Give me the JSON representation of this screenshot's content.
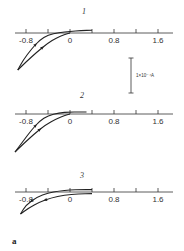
{
  "chart_data": {
    "type": "line",
    "title": "",
    "panel_label": "a",
    "xlabel": "",
    "ylabel": "",
    "x_ticks": [
      -0.8,
      -0.4,
      0,
      0.4,
      0.8,
      1.2,
      1.6
    ],
    "x_tick_labels": [
      "-0.8",
      "0",
      "0.8",
      "1.6"
    ],
    "x_tick_label_values": [
      -0.8,
      0,
      0.8,
      1.6
    ],
    "xlim": [
      -1.05,
      1.85
    ],
    "scale_bar": {
      "label": "1×10⁻⁴A",
      "value_A": 0.0001
    },
    "y_units_per_scale_bar": 1,
    "plots": [
      {
        "label": "1",
        "forward": {
          "x": [
            -0.95,
            -0.8,
            -0.6,
            -0.4,
            -0.25,
            -0.1,
            0.0
          ],
          "y": [
            -1.85,
            -1.45,
            -0.95,
            -0.5,
            -0.25,
            -0.08,
            0.0
          ]
        },
        "reverse": {
          "x": [
            0.4,
            0.2,
            0.0,
            -0.2,
            -0.4,
            -0.55,
            -0.7,
            -0.85,
            -0.95
          ],
          "y": [
            0.14,
            0.12,
            0.08,
            0.02,
            -0.1,
            -0.35,
            -0.8,
            -1.35,
            -1.85
          ]
        }
      },
      {
        "label": "2",
        "forward": {
          "x": [
            -1.0,
            -0.85,
            -0.65,
            -0.45,
            -0.25,
            -0.1,
            0.0
          ],
          "y": [
            -1.9,
            -1.5,
            -1.0,
            -0.55,
            -0.25,
            -0.08,
            0.0
          ]
        },
        "reverse": {
          "x": [
            0.3,
            0.15,
            0.0,
            -0.2,
            -0.4,
            -0.55,
            -0.7,
            -0.85,
            -1.0
          ],
          "y": [
            0.1,
            0.1,
            0.1,
            0.06,
            -0.08,
            -0.35,
            -0.8,
            -1.35,
            -1.9
          ]
        }
      },
      {
        "label": "3",
        "forward": {
          "x": [
            -0.9,
            -0.75,
            -0.55,
            -0.35,
            -0.1,
            0.15,
            0.4
          ],
          "y": [
            -1.1,
            -0.8,
            -0.5,
            -0.3,
            -0.15,
            -0.1,
            -0.08
          ]
        },
        "reverse": {
          "x": [
            0.4,
            0.2,
            0.0,
            -0.2,
            -0.4,
            -0.6,
            -0.8,
            -0.9
          ],
          "y": [
            0.12,
            0.12,
            0.1,
            0.05,
            -0.05,
            -0.25,
            -0.65,
            -1.1
          ]
        }
      }
    ]
  }
}
